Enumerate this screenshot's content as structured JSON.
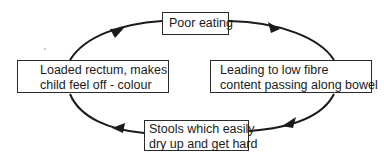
{
  "diagram": {
    "type": "cycle",
    "direction": "clockwise",
    "nodes": [
      {
        "id": "top",
        "lines": [
          "Poor eating"
        ]
      },
      {
        "id": "right",
        "lines": [
          "Leading to low fibre",
          "content passing along bowel"
        ]
      },
      {
        "id": "bottom",
        "lines": [
          "Stools which easily",
          "dry up and get hard"
        ]
      },
      {
        "id": "left",
        "lines": [
          "Loaded rectum, makes",
          "child feel off - colour"
        ]
      }
    ],
    "edges": [
      {
        "from": "top",
        "to": "right"
      },
      {
        "from": "right",
        "to": "bottom"
      },
      {
        "from": "bottom",
        "to": "left"
      },
      {
        "from": "left",
        "to": "top"
      }
    ],
    "colors": {
      "line": "#1a1a1a",
      "box_border": "#2a2a2a",
      "background": "#ffffff"
    }
  }
}
